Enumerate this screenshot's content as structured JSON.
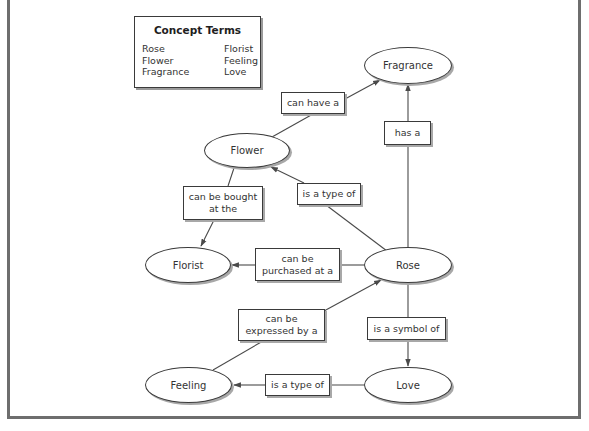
{
  "legend": {
    "title": "Concept Terms",
    "left_terms": [
      "Rose",
      "Flower",
      "Fragrance"
    ],
    "right_terms": [
      "Florist",
      "Feeling",
      "Love"
    ]
  },
  "nodes": {
    "fragrance": "Fragrance",
    "flower": "Flower",
    "florist": "Florist",
    "rose": "Rose",
    "feeling": "Feeling",
    "love": "Love"
  },
  "links": {
    "flower_fragrance": "can have a",
    "rose_fragrance": "has a",
    "flower_florist": "can be bought at the",
    "rose_flower": "is a type of",
    "rose_florist": "can be purchased at a",
    "feeling_rose": "can be expressed by a",
    "rose_love": "is a symbol of",
    "love_feeling": "is a type of"
  },
  "colors": {
    "line": "#4a4a4a",
    "border": "#3a3a3a",
    "frame": "#6e6e6e",
    "shadow": "#a8a8a8"
  }
}
